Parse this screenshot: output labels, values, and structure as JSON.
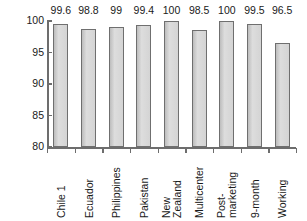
{
  "chart_data": {
    "type": "bar",
    "title": "",
    "xlabel": "",
    "ylabel": "Percent",
    "ylim": [
      80,
      100
    ],
    "yticks": [
      80,
      85,
      90,
      95,
      100
    ],
    "grid": false,
    "legend": null,
    "categories": [
      "Chile 1",
      "Ecuador",
      "Philippines",
      "Pakistan",
      "New Zealand",
      "Multicenter",
      "Post-marketing",
      "9-month",
      "Working"
    ],
    "category_lines": [
      [
        "Chile 1"
      ],
      [
        "Ecuador"
      ],
      [
        "Philippines"
      ],
      [
        "Pakistan"
      ],
      [
        "New",
        "Zealand"
      ],
      [
        "Multicenter"
      ],
      [
        "Post-",
        "marketing"
      ],
      [
        "9-month"
      ],
      [
        "Working"
      ]
    ],
    "values": [
      99.6,
      98.8,
      99,
      99.4,
      100,
      98.5,
      100,
      99.5,
      96.5
    ],
    "value_labels": [
      "99.6",
      "98.8",
      "99",
      "99.4",
      "100",
      "98.5",
      "100",
      "99.5",
      "96.5"
    ],
    "colors": {
      "bar_fill": "#d2d2d2",
      "bar_edge": "#6f6f6f",
      "axis": "#6d6d6d",
      "text": "#1a1a1a",
      "background": "#ffffff"
    }
  }
}
